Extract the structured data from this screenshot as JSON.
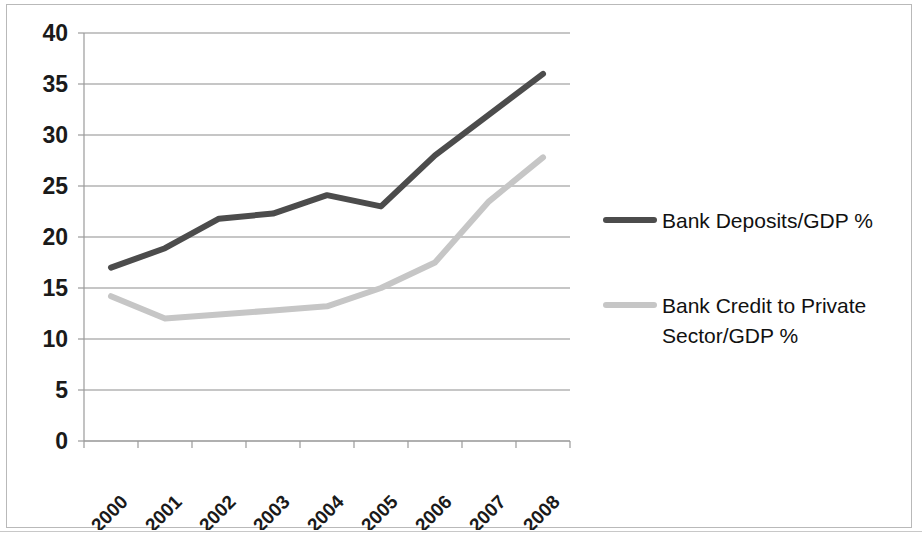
{
  "chart_data": {
    "type": "line",
    "title": "",
    "subtitle": "",
    "xlabel": "",
    "ylabel": "",
    "categories": [
      "2000",
      "2001",
      "2002",
      "2003",
      "2004",
      "2005",
      "2006",
      "2007",
      "2008"
    ],
    "x": [
      2000,
      2001,
      2002,
      2003,
      2004,
      2005,
      2006,
      2007,
      2008
    ],
    "ylim": [
      0,
      40
    ],
    "yticks": [
      0,
      5,
      10,
      15,
      20,
      25,
      30,
      35,
      40
    ],
    "ytick_labels": [
      "0",
      "5",
      "10",
      "15",
      "20",
      "25",
      "30",
      "35",
      "40"
    ],
    "grid": true,
    "grid_axis": "y",
    "legend_position": "right",
    "series": [
      {
        "name": "Bank Deposits/GDP %",
        "color": "#4c4c4c",
        "values": [
          17.0,
          18.9,
          21.8,
          22.3,
          24.1,
          23.0,
          28.0,
          32.0,
          36.0
        ]
      },
      {
        "name": "Bank Credit to Private Sector/GDP %",
        "color": "#c6c6c6",
        "values": [
          14.2,
          12.0,
          12.4,
          12.8,
          13.2,
          15.0,
          17.5,
          23.5,
          27.8
        ]
      }
    ]
  },
  "legend": {
    "entries": [
      {
        "label": "Bank Deposits/GDP %",
        "color": "#4c4c4c"
      },
      {
        "label": "Bank Credit to Private Sector/GDP %",
        "color": "#c6c6c6"
      }
    ]
  },
  "colors": {
    "series_dark": "#4c4c4c",
    "series_light": "#c6c6c6",
    "gridline": "#8d8d8d",
    "axis": "#9a9a9a",
    "frame": "#b9b9b9",
    "text": "#111111",
    "background": "#ffffff"
  }
}
